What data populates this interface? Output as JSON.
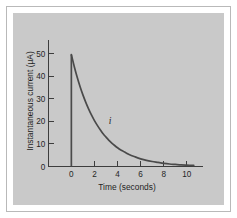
{
  "figure": {
    "background_color": "#ffffff",
    "plot_background_color": "#c9c9c9",
    "frame_border_color": "#b9b9b9",
    "axis_color": "#3d3d3d",
    "curve_color": "#4a4a4a"
  },
  "chart_data": {
    "type": "line",
    "title": "",
    "subtitle": "",
    "xlabel": "Time (seconds)",
    "ylabel": "Instantaneous current (μA)",
    "xlim": [
      -1.2,
      11.4
    ],
    "ylim": [
      0,
      56
    ],
    "xticks": [
      0,
      2,
      4,
      6,
      8,
      10
    ],
    "xticklabels": [
      "0",
      "2",
      "4",
      "6",
      "8",
      "10"
    ],
    "yticks": [
      0,
      10,
      20,
      30,
      40,
      50
    ],
    "yticklabels": [
      "0",
      "10",
      "20",
      "30",
      "40",
      "50"
    ],
    "grid": false,
    "legend": null,
    "tick_direction": "in",
    "annotations": [
      {
        "text": "i",
        "x": 3.35,
        "y": 19.0,
        "style": "italic"
      }
    ],
    "series": [
      {
        "name": "i",
        "description": "Instantaneous current decay",
        "x": [
          0,
          0,
          0.25,
          0.5,
          0.75,
          1.0,
          1.25,
          1.5,
          1.75,
          2.0,
          2.25,
          2.5,
          2.75,
          3.0,
          3.25,
          3.5,
          3.75,
          4.0,
          4.25,
          4.5,
          4.75,
          5.0,
          5.5,
          6.0,
          6.5,
          7.0,
          7.5,
          8.0,
          8.5,
          9.0,
          9.5,
          10.0,
          10.6
        ],
        "values": [
          0,
          49.5,
          44.3,
          39.6,
          35.4,
          31.7,
          28.4,
          25.4,
          22.7,
          20.3,
          18.2,
          16.3,
          14.5,
          13.0,
          11.6,
          10.4,
          9.3,
          8.3,
          7.4,
          6.7,
          6.0,
          5.3,
          4.3,
          3.4,
          2.7,
          2.2,
          1.8,
          1.4,
          1.1,
          0.9,
          0.7,
          0.6,
          0.5
        ]
      }
    ],
    "peak_value": 49.5,
    "peak_unit": "μA",
    "decay_time_constant": 2.2
  }
}
